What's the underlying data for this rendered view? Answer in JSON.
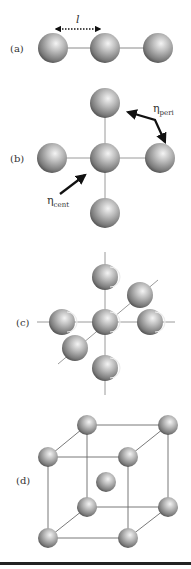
{
  "figure": {
    "panels": [
      {
        "label": "(a)",
        "description": "linear chain of three spheres",
        "annotation": "l"
      },
      {
        "label": "(b)",
        "description": "planar cross of five spheres",
        "annotations": {
          "peri": {
            "symbol": "η",
            "subscript": "peri"
          },
          "cent": {
            "symbol": "η",
            "subscript": "cent"
          }
        }
      },
      {
        "label": "(c)",
        "description": "3D octahedral arrangement of seven spheres"
      },
      {
        "label": "(d)",
        "description": "body-centered cubic unit cell"
      }
    ]
  },
  "colors": {
    "sphere_light": "#f2f2f2",
    "sphere_mid": "#9a9a9a",
    "sphere_dark": "#3a3a3a",
    "line": "#8a8a8a",
    "arrow": "#111111",
    "rule": "#222222"
  }
}
